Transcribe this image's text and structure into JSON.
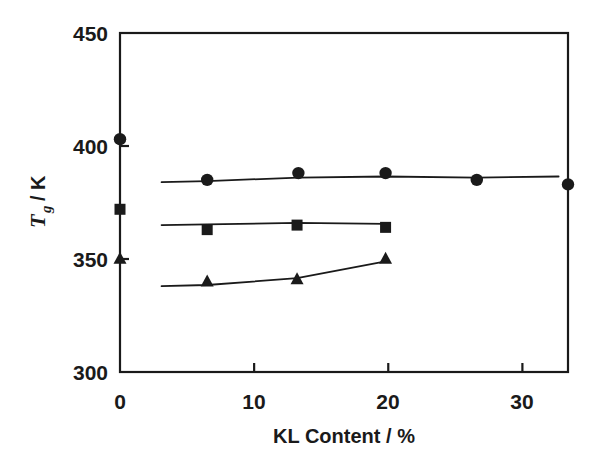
{
  "chart_data": {
    "type": "scatter",
    "title": "",
    "xlabel": "KL Content / %",
    "ylabel": "T_g / K",
    "ylabel_main": "T",
    "ylabel_sub": "g",
    "ylabel_unit": "/ K",
    "xlim": [
      0,
      33.4
    ],
    "ylim": [
      300,
      450
    ],
    "xticks": [
      0,
      10,
      20,
      30
    ],
    "xtick_labels": [
      "0",
      "10",
      "20",
      "30"
    ],
    "yticks": [
      300,
      350,
      400,
      450
    ],
    "ytick_labels": [
      "300",
      "350",
      "400",
      "450"
    ],
    "grid": false,
    "legend": "none",
    "marker_color": "#1a1a1a",
    "line_color": "#1a1a1a",
    "series": [
      {
        "name": "circle-series",
        "marker": "circle",
        "x": [
          6.5,
          13.3,
          19.8,
          26.6,
          33.4
        ],
        "values": [
          385,
          388,
          388,
          385,
          383
        ],
        "line_x": [
          3.1,
          6.5,
          13.3,
          19.8,
          26.6,
          32.7
        ],
        "line_y": [
          384,
          384.5,
          386,
          386.5,
          386,
          386.5
        ]
      },
      {
        "name": "square-series",
        "marker": "square",
        "x": [
          6.5,
          13.2,
          19.8
        ],
        "values": [
          363,
          365,
          364
        ],
        "line_x": [
          3.1,
          6.5,
          13.2,
          19.8
        ],
        "line_y": [
          365,
          365.3,
          366,
          365.5
        ]
      },
      {
        "name": "triangle-series",
        "marker": "triangle",
        "x": [
          6.5,
          13.2,
          19.8
        ],
        "values": [
          340,
          341,
          350
        ],
        "line_x": [
          3.1,
          6.5,
          13.2,
          19.8
        ],
        "line_y": [
          338,
          338.5,
          341.5,
          349
        ]
      }
    ],
    "axis_points": [
      {
        "name": "circle-axis-point",
        "marker": "circle",
        "x": 0,
        "value": 403
      },
      {
        "name": "square-axis-point",
        "marker": "square",
        "x": 0,
        "value": 372
      },
      {
        "name": "triangle-axis-point",
        "marker": "triangle",
        "x": 0,
        "value": 350
      }
    ]
  }
}
